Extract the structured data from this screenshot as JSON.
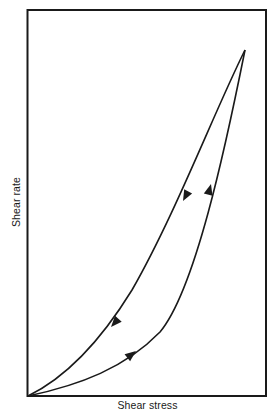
{
  "diagram": {
    "title": "",
    "type": "hysteresis-loop",
    "x_axis_label": "Shear stress",
    "y_axis_label": "Shear rate",
    "colors": {
      "line": "#1a1a1a",
      "background": "#ffffff"
    },
    "curves": [
      {
        "name": "up-curve",
        "direction": "increasing (origin to peak)",
        "arrows": 2
      },
      {
        "name": "down-curve",
        "direction": "decreasing (peak to origin)",
        "arrows": 2
      }
    ]
  }
}
